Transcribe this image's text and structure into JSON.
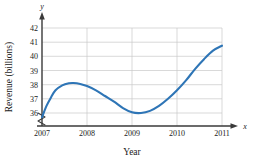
{
  "chart_data": {
    "type": "line",
    "title": "",
    "xlabel": "Year",
    "ylabel": "Revenue (billions)",
    "x_var_label": "x",
    "y_var_label": "y",
    "xlim": [
      2007,
      2011
    ],
    "ylim": [
      35.4,
      42
    ],
    "y_axis_break": true,
    "grid": true,
    "legend": null,
    "line_color": "#2E75B6",
    "grid_color": "#C9C9C9",
    "axis_color": "#3A3A3A",
    "xticks": [
      "2007",
      "2008",
      "2009",
      "2010",
      "2011"
    ],
    "xtick_values": [
      2007,
      2008,
      2009,
      2010,
      2011
    ],
    "yticks": [
      "36",
      "37",
      "38",
      "39",
      "40",
      "41",
      "42"
    ],
    "ytick_values": [
      36,
      37,
      38,
      39,
      40,
      41,
      42
    ],
    "series": [
      {
        "name": "Revenue",
        "x": [
          2007.0,
          2007.1,
          2007.2,
          2007.3,
          2007.45,
          2007.6,
          2007.7,
          2007.85,
          2008.0,
          2008.2,
          2008.4,
          2008.6,
          2008.8,
          2009.0,
          2009.2,
          2009.4,
          2009.6,
          2009.8,
          2010.0,
          2010.2,
          2010.4,
          2010.6,
          2010.8,
          2011.0
        ],
        "y": [
          35.7,
          36.5,
          37.1,
          37.6,
          37.95,
          38.1,
          38.12,
          38.05,
          37.9,
          37.6,
          37.2,
          36.8,
          36.35,
          36.05,
          36.0,
          36.15,
          36.5,
          37.0,
          37.6,
          38.3,
          39.1,
          39.8,
          40.4,
          40.75
        ]
      }
    ]
  }
}
